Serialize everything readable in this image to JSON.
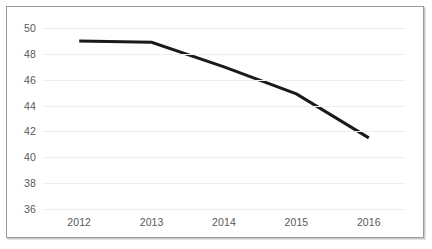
{
  "chart_data": {
    "type": "line",
    "title": "",
    "subtitle": "",
    "xlabel": "",
    "ylabel": "",
    "categories": [
      "2012",
      "2013",
      "2014",
      "2015",
      "2016"
    ],
    "series": [
      {
        "name": "",
        "values": [
          49,
          48.9,
          47,
          44.9,
          41.5
        ]
      }
    ],
    "ylim": [
      36,
      50
    ],
    "yticks": [
      36,
      38,
      40,
      42,
      44,
      46,
      48,
      50
    ],
    "ytick_labels": [
      "36",
      "38",
      "40",
      "42",
      "44",
      "46",
      "48",
      "50"
    ],
    "xtick_labels": [
      "2012",
      "2013",
      "2014",
      "2015",
      "2016"
    ],
    "grid": {
      "horizontal": true,
      "vertical": false,
      "color": "#eceff1"
    },
    "legend": {
      "visible": false,
      "position": "none",
      "entries": []
    },
    "markers": false,
    "line_color": "#1a1a1a",
    "line_width": 3,
    "plot_background": "#ffffff",
    "border_color": "#9a9a9a",
    "tick_label_color": "#58585a",
    "annotations": []
  }
}
